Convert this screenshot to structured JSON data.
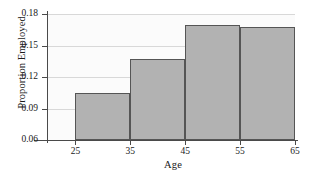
{
  "chart_data": {
    "type": "bar",
    "title": "",
    "xlabel": "Age",
    "ylabel": "Proportion Employed",
    "categories": [
      "25-35",
      "35-45",
      "45-55",
      "55-65"
    ],
    "bin_edges": [
      25,
      35,
      45,
      55,
      65
    ],
    "values": [
      0.105,
      0.137,
      0.17,
      0.168
    ],
    "xlim": [
      20,
      65
    ],
    "ylim": [
      0.06,
      0.18
    ],
    "xticks": [
      "25",
      "35",
      "45",
      "55",
      "65"
    ],
    "xtick_values": [
      25,
      35,
      45,
      55,
      65
    ],
    "yticks": [
      "0.06",
      "0.09",
      "0.12",
      "0.15",
      "0.18"
    ],
    "ytick_values": [
      0.06,
      0.09,
      0.12,
      0.15,
      0.18
    ],
    "grid": true,
    "grid_axis": "y",
    "legend": null,
    "bar_fill_color": "#b2b2b2",
    "bar_edge_color": "#555555",
    "plot_background_color": "#fbfbfb",
    "axis_color": "#4a4a4a",
    "gridline_color": "#d8d8d8"
  }
}
